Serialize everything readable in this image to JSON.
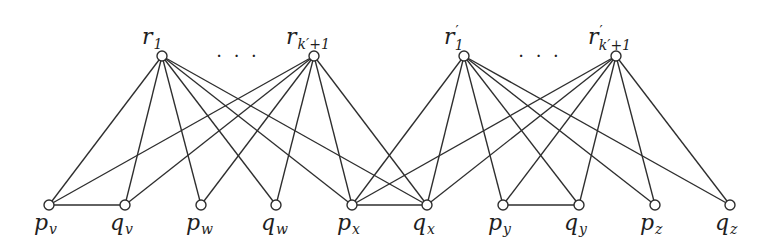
{
  "diagram": {
    "type": "graph",
    "top_nodes": [
      {
        "id": "r1",
        "base": "r",
        "prime": "",
        "sub": "1",
        "x": 162,
        "y": 56
      },
      {
        "id": "rk1",
        "base": "r",
        "prime": "",
        "sub": "k′+1",
        "x": 314,
        "y": 56
      },
      {
        "id": "rp1",
        "base": "r",
        "prime": "′",
        "sub": "1",
        "x": 464,
        "y": 56
      },
      {
        "id": "rpk1",
        "base": "r",
        "prime": "′",
        "sub": "k′+1",
        "x": 616,
        "y": 56
      }
    ],
    "ellipses": [
      {
        "text": "· · ·",
        "x": 238,
        "y": 62
      },
      {
        "text": "· · ·",
        "x": 540,
        "y": 62
      }
    ],
    "bottom_nodes": [
      {
        "id": "pv",
        "base": "p",
        "sub": "v",
        "x": 49,
        "y": 205
      },
      {
        "id": "qv",
        "base": "q",
        "sub": "v",
        "x": 125,
        "y": 205
      },
      {
        "id": "pw",
        "base": "p",
        "sub": "w",
        "x": 201,
        "y": 205
      },
      {
        "id": "qw",
        "base": "q",
        "sub": "w",
        "x": 276,
        "y": 205
      },
      {
        "id": "px",
        "base": "p",
        "sub": "x",
        "x": 352,
        "y": 205
      },
      {
        "id": "qx",
        "base": "q",
        "sub": "x",
        "x": 427,
        "y": 205
      },
      {
        "id": "py",
        "base": "p",
        "sub": "y",
        "x": 503,
        "y": 205
      },
      {
        "id": "qy",
        "base": "q",
        "sub": "y",
        "x": 579,
        "y": 205
      },
      {
        "id": "pz",
        "base": "p",
        "sub": "z",
        "x": 655,
        "y": 205
      },
      {
        "id": "qz",
        "base": "q",
        "sub": "z",
        "x": 730,
        "y": 205
      }
    ],
    "edges": [
      [
        "r1",
        "pv"
      ],
      [
        "r1",
        "qv"
      ],
      [
        "r1",
        "pw"
      ],
      [
        "r1",
        "qw"
      ],
      [
        "r1",
        "px"
      ],
      [
        "r1",
        "qx"
      ],
      [
        "rk1",
        "pv"
      ],
      [
        "rk1",
        "qv"
      ],
      [
        "rk1",
        "pw"
      ],
      [
        "rk1",
        "qw"
      ],
      [
        "rk1",
        "px"
      ],
      [
        "rk1",
        "qx"
      ],
      [
        "rp1",
        "px"
      ],
      [
        "rp1",
        "qx"
      ],
      [
        "rp1",
        "py"
      ],
      [
        "rp1",
        "qy"
      ],
      [
        "rp1",
        "pz"
      ],
      [
        "rp1",
        "qz"
      ],
      [
        "rpk1",
        "px"
      ],
      [
        "rpk1",
        "qx"
      ],
      [
        "rpk1",
        "py"
      ],
      [
        "rpk1",
        "qy"
      ],
      [
        "rpk1",
        "pz"
      ],
      [
        "rpk1",
        "qz"
      ],
      [
        "pv",
        "qv"
      ],
      [
        "px",
        "qx"
      ],
      [
        "py",
        "qy"
      ]
    ],
    "node_radius": 5,
    "colors": {
      "stroke": "#2e2e2e",
      "fill": "#ffffff",
      "label": "#1e1e1e"
    }
  }
}
